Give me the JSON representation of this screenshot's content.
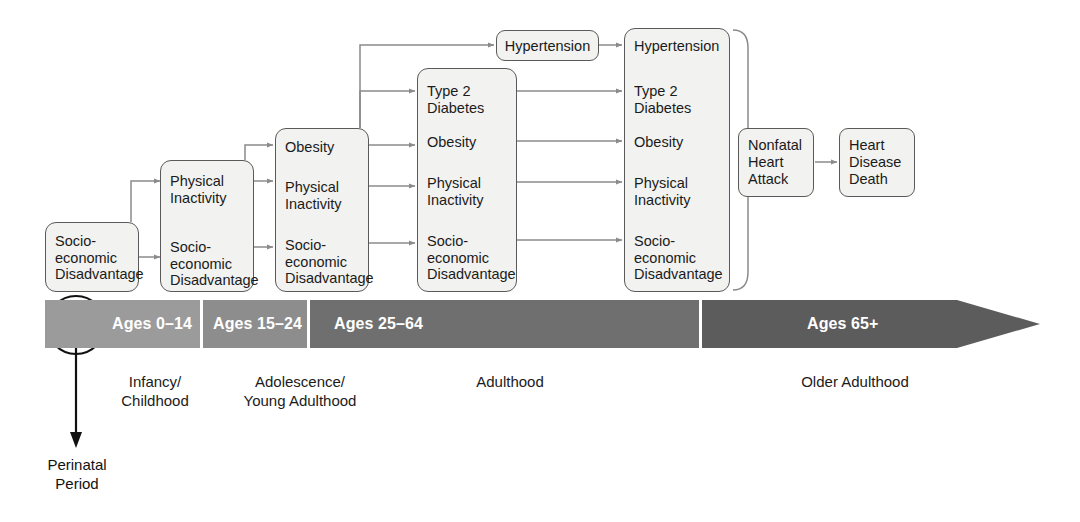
{
  "diagram": {
    "stages": [
      {
        "id": "stage-0-14",
        "age_label": "Ages 0–14",
        "life_label": "Infancy/\nChildhood",
        "band_color": "#9b9b9b",
        "items": [
          "Socio-\neconomic\nDisadvantage"
        ]
      },
      {
        "id": "stage-15-24",
        "age_label": "Ages 15–24",
        "life_label": "Adolescence/\nYoung Adulthood",
        "band_color": "#8d8d8d",
        "items": [
          "Physical\nInactivity",
          "Socio-\neconomic\nDisadvantage"
        ]
      },
      {
        "id": "stage-25-64",
        "age_label": "Ages 25–64",
        "life_label": "Adulthood",
        "band_color": "#6f6f6f",
        "items": [
          "Obesity",
          "Physical\nInactivity",
          "Socio-\neconomic\nDisadvantage"
        ]
      },
      {
        "id": "stage-65-plus",
        "age_label": "Ages 65+",
        "life_label": "Older Adulthood",
        "band_color": "#5c5c5c",
        "items": []
      }
    ],
    "columns": [
      {
        "id": "column-childhood",
        "items": [
          "Socio-\neconomic\nDisadvantage"
        ]
      },
      {
        "id": "column-adolescence",
        "items": [
          "Physical\nInactivity",
          "Socio-\neconomic\nDisadvantage"
        ]
      },
      {
        "id": "column-young-adult",
        "items": [
          "Obesity",
          "Physical\nInactivity",
          "Socio-\neconomic\nDisadvantage"
        ]
      },
      {
        "id": "column-adult-early",
        "items": [
          "Type 2\nDiabetes",
          "Obesity",
          "Physical\nInactivity",
          "Socio-\neconomic\nDisadvantage"
        ]
      },
      {
        "id": "column-adult-late",
        "items": [
          "Hypertension",
          "Type 2\nDiabetes",
          "Obesity",
          "Physical\nInactivity",
          "Socio-\neconomic\nDisadvantage"
        ]
      }
    ],
    "hypertension_box": "Hypertension",
    "outcome_boxes": [
      {
        "id": "nonfatal-heart-attack",
        "label": "Nonfatal\nHeart\nAttack"
      },
      {
        "id": "heart-disease-death",
        "label": "Heart\nDisease\nDeath"
      }
    ],
    "perinatal_annotation": "Perinatal\nPeriod",
    "colors": {
      "box_border": "#5a5a5a",
      "box_fill": "#f2f2f0",
      "connector": "#8b8b8b",
      "annotation": "#111111",
      "band_text": "#ffffff"
    }
  }
}
